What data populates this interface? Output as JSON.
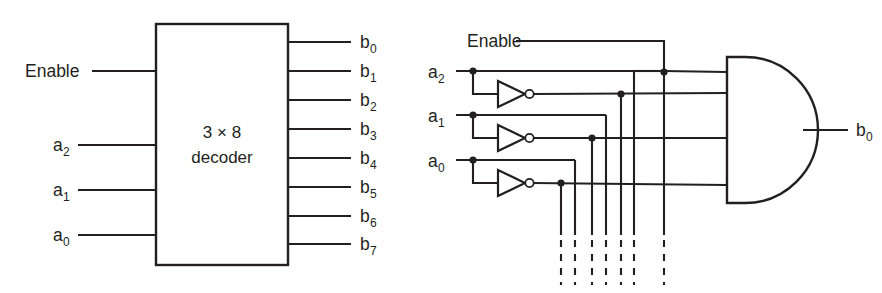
{
  "figure": {
    "ink_color": "#231f20",
    "background_color": "#ffffff"
  },
  "left_diagram": {
    "name": "decoder-block-symbol",
    "block": {
      "line1": "3 × 8",
      "line2": "decoder"
    },
    "inputs": [
      {
        "label": "Enable",
        "sub": "",
        "y": 71
      },
      {
        "label": "a",
        "sub": "2",
        "y": 145
      },
      {
        "label": "a",
        "sub": "1",
        "y": 190
      },
      {
        "label": "a",
        "sub": "0",
        "y": 235
      }
    ],
    "outputs": [
      {
        "label": "b",
        "sub": "0",
        "y": 42
      },
      {
        "label": "b",
        "sub": "1",
        "y": 71
      },
      {
        "label": "b",
        "sub": "2",
        "y": 100
      },
      {
        "label": "b",
        "sub": "3",
        "y": 129
      },
      {
        "label": "b",
        "sub": "4",
        "y": 158
      },
      {
        "label": "b",
        "sub": "5",
        "y": 187
      },
      {
        "label": "b",
        "sub": "6",
        "y": 216
      },
      {
        "label": "b",
        "sub": "7",
        "y": 244
      }
    ]
  },
  "right_diagram": {
    "name": "decoder-internal-circuit",
    "enable_label": "Enable",
    "inputs": [
      {
        "label": "a",
        "sub": "2",
        "y": 71
      },
      {
        "label": "a",
        "sub": "1",
        "y": 115
      },
      {
        "label": "a",
        "sub": "0",
        "y": 160
      }
    ],
    "inverters": [
      {
        "name": "inverter-a2",
        "input_y": 71,
        "output_y": 94
      },
      {
        "name": "inverter-a1",
        "input_y": 115,
        "output_y": 138
      },
      {
        "name": "inverter-a0",
        "input_y": 160,
        "output_y": 183
      }
    ],
    "and_gate": {
      "name": "and-gate-b0",
      "input_count": 4,
      "inputs": [
        {
          "signal": "Enable",
          "y": 72
        },
        {
          "signal": "a2'",
          "y": 93
        },
        {
          "signal": "a1'",
          "y": 138
        },
        {
          "signal": "a0'",
          "y": 185
        }
      ]
    },
    "output": {
      "label": "b",
      "sub": "0",
      "y": 130
    },
    "bus_lines": [
      {
        "name": "bus-a0-inv",
        "x": 561
      },
      {
        "name": "bus-a0",
        "x": 575
      },
      {
        "name": "bus-a1-inv",
        "x": 592
      },
      {
        "name": "bus-a1",
        "x": 606
      },
      {
        "name": "bus-a2-inv",
        "x": 621
      },
      {
        "name": "bus-a2",
        "x": 634
      },
      {
        "name": "bus-enable",
        "x": 664
      }
    ]
  }
}
